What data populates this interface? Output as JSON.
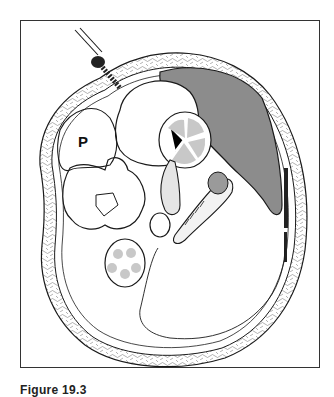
{
  "figure": {
    "caption": "Figure 19.3",
    "labels": {
      "psoas": "P"
    },
    "colors": {
      "line": "#1a1a1a",
      "spleen_fill": "#8c8c8c",
      "kidney_fill": "#d8d8d8",
      "background": "#ffffff",
      "muscle_dark": "#222222"
    }
  }
}
